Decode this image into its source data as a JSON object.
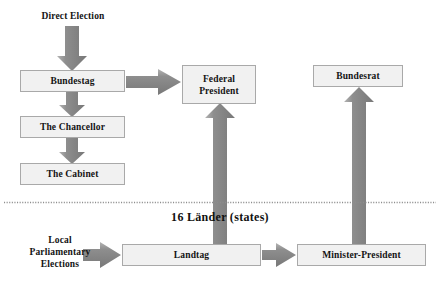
{
  "diagram": {
    "colors": {
      "arrow": "#8c8c8c",
      "arrow_dark": "#808080",
      "box_fill": "#f1f1f1",
      "box_border": "#a9a9a9",
      "text": "#141414",
      "divider": "#9a9a9a",
      "background": "#ffffff"
    },
    "federal_level": {
      "nodes": [
        {
          "id": "bundestag",
          "label": "Bundestag"
        },
        {
          "id": "chancellor",
          "label": "The Chancellor"
        },
        {
          "id": "cabinet",
          "label": "The Cabinet"
        },
        {
          "id": "federal_president",
          "label_line1": "Federal",
          "label_line2": "President"
        },
        {
          "id": "bundesrat",
          "label": "Bundesrat"
        }
      ],
      "source_label": "Direct Election"
    },
    "divider": {
      "style": "dotted",
      "label": "16 Länder  (states)"
    },
    "state_level": {
      "source_label_line1": "Local",
      "source_label_line2": "Parliamentary",
      "source_label_line3": "Elections",
      "nodes": [
        {
          "id": "landtag",
          "label": "Landtag"
        },
        {
          "id": "minister_president",
          "label": "Minister-President"
        }
      ]
    },
    "edges": [
      {
        "id": "direct-election-to-bundestag",
        "from": "Direct Election",
        "to": "Bundestag",
        "direction": "down"
      },
      {
        "id": "bundestag-to-chancellor",
        "from": "Bundestag",
        "to": "The Chancellor",
        "direction": "down"
      },
      {
        "id": "chancellor-to-cabinet",
        "from": "The Chancellor",
        "to": "The Cabinet",
        "direction": "down"
      },
      {
        "id": "bundestag-to-federal-president",
        "from": "Bundestag",
        "to": "Federal President",
        "direction": "right"
      },
      {
        "id": "landtag-to-federal-president",
        "from": "Landtag",
        "to": "Federal President",
        "direction": "up"
      },
      {
        "id": "minister-president-to-bundesrat",
        "from": "Minister-President",
        "to": "Bundesrat",
        "direction": "up"
      },
      {
        "id": "local-elections-to-landtag",
        "from": "Local Parliamentary Elections",
        "to": "Landtag",
        "direction": "right"
      },
      {
        "id": "landtag-to-minister-president",
        "from": "Landtag",
        "to": "Minister-President",
        "direction": "right"
      }
    ]
  }
}
